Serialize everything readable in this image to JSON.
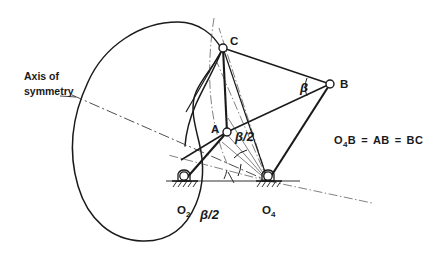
{
  "figure": {
    "background_color": "#ffffff",
    "ink_color": "#1a1a1a",
    "width": 427,
    "height": 257
  },
  "annotations": {
    "axis_label_line1": "Axis of",
    "axis_label_line2": "symmetry",
    "equation": "O₄B = AB = BC",
    "equation_parts": {
      "term1_base": "O",
      "term1_sub": "4",
      "term1_tail": "B",
      "operator1": "=",
      "term2": "AB",
      "operator2": "=",
      "term3": "BC"
    }
  },
  "joints": [
    {
      "id": "C",
      "label": "C",
      "x": 223,
      "y": 48,
      "type": "moving-pin",
      "label_dx": 7,
      "label_dy": -3
    },
    {
      "id": "B",
      "label": "B",
      "x": 330,
      "y": 84,
      "type": "moving-pin",
      "label_dx": 10,
      "label_dy": 4
    },
    {
      "id": "A",
      "label": "A",
      "x": 227,
      "y": 132,
      "type": "moving-pin",
      "label_dx": -16,
      "label_dy": 1
    },
    {
      "id": "O2",
      "label": "O",
      "sub": "2",
      "x": 184,
      "y": 181,
      "type": "ground-pivot",
      "label_dx": -7,
      "label_dy": 33
    },
    {
      "id": "O4",
      "label": "O",
      "sub": "4",
      "x": 268,
      "y": 181,
      "type": "ground-pivot",
      "label_dx": -6,
      "label_dy": 33
    }
  ],
  "links": [
    {
      "name": "crank-O2-A",
      "from": "O2",
      "to": "A"
    },
    {
      "name": "coupler-A-C",
      "from": "A",
      "to": "C"
    },
    {
      "name": "coupler-A-B",
      "from": "A",
      "to": "B"
    },
    {
      "name": "coupler-C-B",
      "from": "C",
      "to": "B"
    },
    {
      "name": "rocker-B-O4",
      "from": "B",
      "to": "O4"
    },
    {
      "name": "link-A-O4",
      "from": "A",
      "to": "O4"
    },
    {
      "name": "link-C-O4",
      "from": "C",
      "to": "O4"
    }
  ],
  "angles": [
    {
      "name": "beta-at-B",
      "label": "β",
      "x": 305,
      "y": 88
    },
    {
      "name": "beta-half-at-A",
      "label": "β/2",
      "x": 238,
      "y": 137
    },
    {
      "name": "beta-half-at-base",
      "label": "β/2",
      "x": 206,
      "y": 215
    }
  ],
  "cam": {
    "name": "cam-profile",
    "description": "kidney shaped closed cam curve"
  },
  "axis_of_symmetry": {
    "name": "axis-of-symmetry-line",
    "style": "dash-dot"
  }
}
